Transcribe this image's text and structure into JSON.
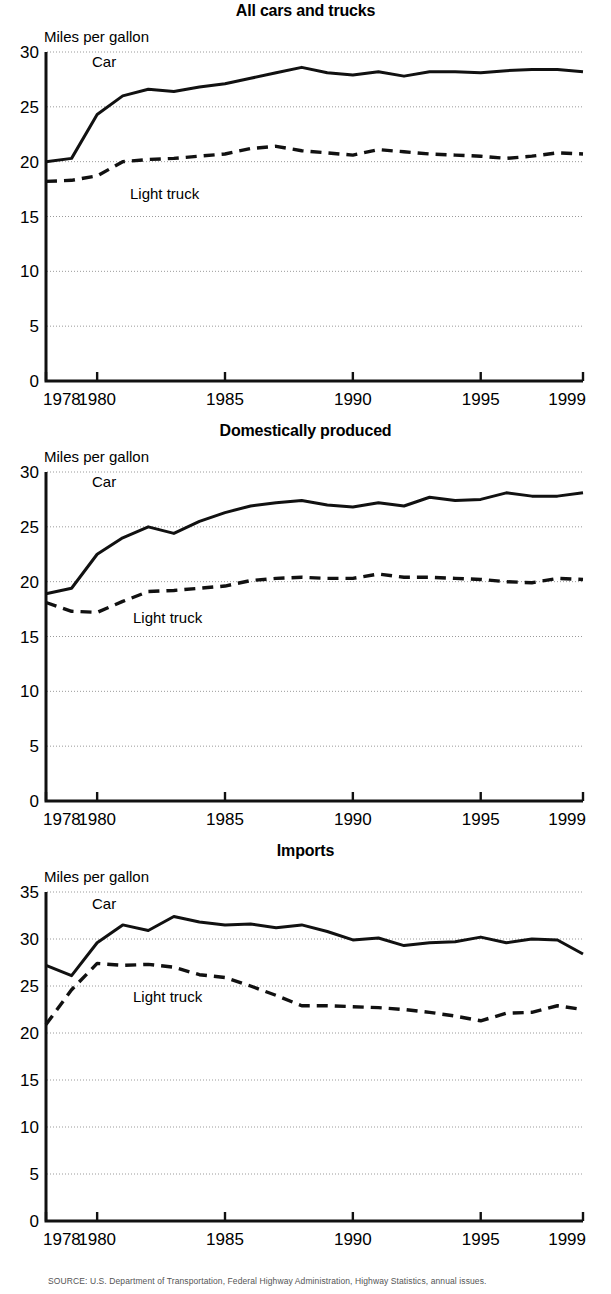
{
  "figure": {
    "source_note": "SOURCE: U.S. Department of Transportation, Federal Highway Administration, Highway Statistics, annual issues."
  },
  "panels": [
    {
      "title": "All cars and trucks",
      "ylabel": "Miles per gallon",
      "car_label": "Car",
      "truck_label": "Light truck",
      "yticks": [
        "0",
        "5",
        "10",
        "15",
        "20",
        "25",
        "30"
      ],
      "xticks": [
        "1978",
        "1980",
        "1985",
        "1990",
        "1995",
        "1999"
      ]
    },
    {
      "title": "Domestically produced",
      "ylabel": "Miles per gallon",
      "car_label": "Car",
      "truck_label": "Light truck",
      "yticks": [
        "0",
        "5",
        "10",
        "15",
        "20",
        "25",
        "30"
      ],
      "xticks": [
        "1978",
        "1980",
        "1985",
        "1990",
        "1995",
        "1999"
      ]
    },
    {
      "title": "Imports",
      "ylabel": "Miles per gallon",
      "car_label": "Car",
      "truck_label": "Light truck",
      "yticks": [
        "0",
        "5",
        "10",
        "15",
        "20",
        "25",
        "30",
        "35"
      ],
      "xticks": [
        "1978",
        "1980",
        "1985",
        "1990",
        "1995",
        "1999"
      ]
    }
  ],
  "chart_data": [
    {
      "type": "line",
      "title": "All cars and trucks",
      "xlabel": "",
      "ylabel": "Miles per gallon",
      "xlim": [
        1978,
        1999
      ],
      "ylim": [
        0,
        30
      ],
      "yticks": [
        0,
        5,
        10,
        15,
        20,
        25,
        30
      ],
      "xticks": [
        1978,
        1980,
        1985,
        1990,
        1995,
        1999
      ],
      "grid": "horizontal-dotted",
      "legend": "inline-annotations",
      "x": [
        1978,
        1979,
        1980,
        1981,
        1982,
        1983,
        1984,
        1985,
        1986,
        1987,
        1988,
        1989,
        1990,
        1991,
        1992,
        1993,
        1994,
        1995,
        1996,
        1997,
        1998,
        1999
      ],
      "series": [
        {
          "name": "Car",
          "style": "solid",
          "values": [
            20.0,
            20.3,
            24.3,
            26.0,
            26.6,
            26.4,
            26.8,
            27.1,
            27.6,
            28.1,
            28.6,
            28.1,
            27.9,
            28.2,
            27.8,
            28.2,
            28.2,
            28.1,
            28.3,
            28.4,
            28.4,
            28.2
          ]
        },
        {
          "name": "Light truck",
          "style": "dashed",
          "values": [
            18.2,
            18.3,
            18.7,
            20.0,
            20.2,
            20.3,
            20.5,
            20.7,
            21.2,
            21.4,
            21.0,
            20.8,
            20.6,
            21.1,
            20.9,
            20.7,
            20.6,
            20.5,
            20.3,
            20.5,
            20.8,
            20.7
          ]
        }
      ]
    },
    {
      "type": "line",
      "title": "Domestically produced",
      "xlabel": "",
      "ylabel": "Miles per gallon",
      "xlim": [
        1978,
        1999
      ],
      "ylim": [
        0,
        30
      ],
      "yticks": [
        0,
        5,
        10,
        15,
        20,
        25,
        30
      ],
      "xticks": [
        1978,
        1980,
        1985,
        1990,
        1995,
        1999
      ],
      "grid": "horizontal-dotted",
      "legend": "inline-annotations",
      "x": [
        1978,
        1979,
        1980,
        1981,
        1982,
        1983,
        1984,
        1985,
        1986,
        1987,
        1988,
        1989,
        1990,
        1991,
        1992,
        1993,
        1994,
        1995,
        1996,
        1997,
        1998,
        1999
      ],
      "series": [
        {
          "name": "Car",
          "style": "solid",
          "values": [
            18.9,
            19.4,
            22.5,
            24.0,
            25.0,
            24.4,
            25.5,
            26.3,
            26.9,
            27.2,
            27.4,
            27.0,
            26.8,
            27.2,
            26.9,
            27.7,
            27.4,
            27.5,
            28.1,
            27.8,
            27.8,
            28.1
          ]
        },
        {
          "name": "Light truck",
          "style": "dashed",
          "values": [
            18.1,
            17.3,
            17.2,
            18.2,
            19.1,
            19.2,
            19.4,
            19.6,
            20.1,
            20.3,
            20.4,
            20.3,
            20.3,
            20.7,
            20.4,
            20.4,
            20.3,
            20.2,
            20.0,
            19.9,
            20.3,
            20.2
          ]
        }
      ]
    },
    {
      "type": "line",
      "title": "Imports",
      "xlabel": "",
      "ylabel": "Miles per gallon",
      "xlim": [
        1978,
        1999
      ],
      "ylim": [
        0,
        35
      ],
      "yticks": [
        0,
        5,
        10,
        15,
        20,
        25,
        30,
        35
      ],
      "xticks": [
        1978,
        1980,
        1985,
        1990,
        1995,
        1999
      ],
      "grid": "horizontal-dotted",
      "legend": "inline-annotations",
      "x": [
        1978,
        1979,
        1980,
        1981,
        1982,
        1983,
        1984,
        1985,
        1986,
        1987,
        1988,
        1989,
        1990,
        1991,
        1992,
        1993,
        1994,
        1995,
        1996,
        1997,
        1998,
        1999
      ],
      "series": [
        {
          "name": "Car",
          "style": "solid",
          "values": [
            27.2,
            26.1,
            29.6,
            31.5,
            30.9,
            32.4,
            31.8,
            31.5,
            31.6,
            31.2,
            31.5,
            30.8,
            29.9,
            30.1,
            29.3,
            29.6,
            29.7,
            30.2,
            29.6,
            30.0,
            29.9,
            28.4
          ]
        },
        {
          "name": "Light truck",
          "style": "dashed",
          "values": [
            20.9,
            24.6,
            27.4,
            27.2,
            27.3,
            27.0,
            26.2,
            25.9,
            25.0,
            24.0,
            22.9,
            22.9,
            22.8,
            22.7,
            22.5,
            22.2,
            21.8,
            21.3,
            22.1,
            22.2,
            22.9,
            22.5
          ]
        }
      ]
    }
  ]
}
